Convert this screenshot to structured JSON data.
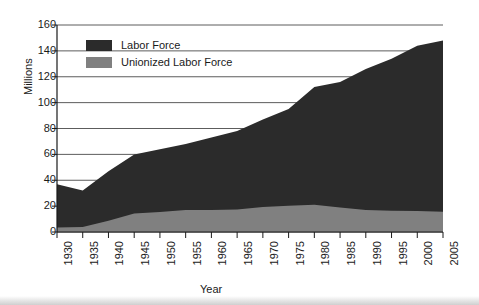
{
  "chart_data": {
    "type": "area",
    "stacked": false,
    "title": "",
    "xlabel": "Year",
    "ylabel": "Millions",
    "xlim": [
      1930,
      2005
    ],
    "ylim": [
      0,
      160
    ],
    "ytick_step": 20,
    "grid": "horizontal",
    "legend_position": "top-left-inside",
    "categories": [
      1930,
      1935,
      1940,
      1945,
      1950,
      1955,
      1960,
      1965,
      1970,
      1975,
      1980,
      1985,
      1990,
      1995,
      2000,
      2005
    ],
    "x": [
      1930,
      1935,
      1940,
      1945,
      1950,
      1955,
      1960,
      1965,
      1970,
      1975,
      1980,
      1985,
      1990,
      1995,
      2000,
      2005
    ],
    "xtick_labels": [
      "1930",
      "1935",
      "1940",
      "1945",
      "1950",
      "1955",
      "1960",
      "1965",
      "1970",
      "1975",
      "1980",
      "1985",
      "1990",
      "1995",
      "2000",
      "2005"
    ],
    "ytick_labels": [
      "0",
      "20",
      "40",
      "60",
      "80",
      "100",
      "120",
      "140",
      "160"
    ],
    "ytick_values": [
      0,
      20,
      40,
      60,
      80,
      100,
      120,
      140,
      160
    ],
    "series": [
      {
        "name": "Labor Force",
        "color": "#2b2b2b",
        "values": [
          37,
          32,
          47,
          60,
          64,
          68,
          73,
          78,
          87,
          95,
          112,
          116,
          126,
          134,
          144,
          148
        ]
      },
      {
        "name": "Unionized Labor Force",
        "color": "#808080",
        "values": [
          3.4,
          3.8,
          8.7,
          14.3,
          15.5,
          17.0,
          17.0,
          17.3,
          19.4,
          20.2,
          21.0,
          19.0,
          17.0,
          16.4,
          16.3,
          15.7
        ]
      }
    ]
  },
  "legend": {
    "items": [
      {
        "label": "Labor Force",
        "color": "#2b2b2b"
      },
      {
        "label": "Unionized Labor Force",
        "color": "#808080"
      }
    ]
  },
  "axes": {
    "y_title": "Millions",
    "x_title": "Year"
  },
  "colors": {
    "labor_force": "#2b2b2b",
    "unionized": "#808080",
    "axis": "#1a1a1a",
    "grid": "#4a4a4a",
    "background": "#ffffff"
  }
}
